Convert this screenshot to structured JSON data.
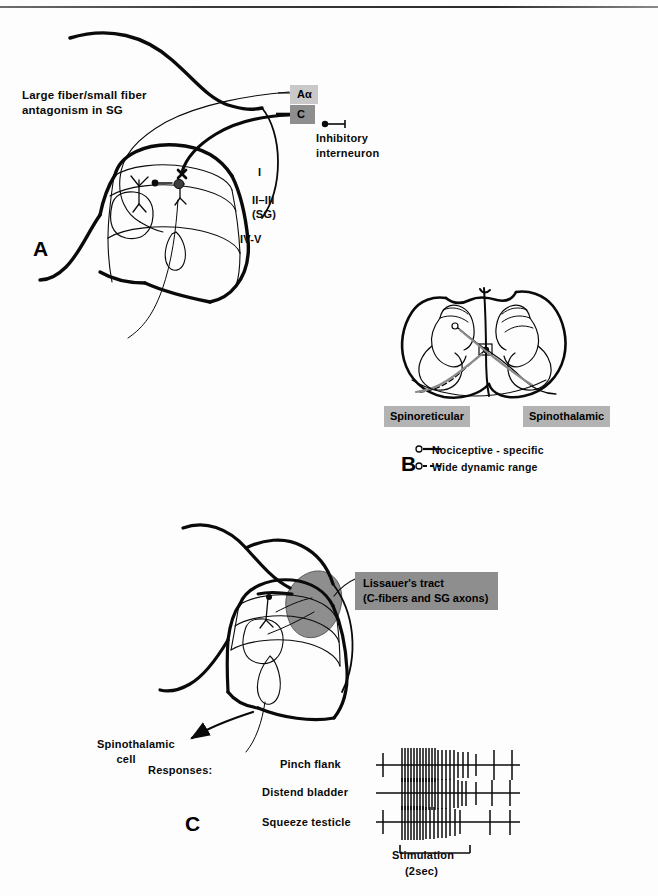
{
  "figure": {
    "panels": {
      "a": {
        "letter": "A",
        "title": "Large fiber/small fiber\nantagonism in SG",
        "fiber_aalpha": "Aα",
        "fiber_c": "C",
        "inhibitory": "Inhibitory\ninterneuron",
        "lamina_1": "I",
        "lamina_2_3": "II–III",
        "lamina_sg": "(SG)",
        "lamina_4_5": "IV-V"
      },
      "b": {
        "letter": "B",
        "tract_left": "Spinoreticular",
        "tract_right": "Spinothalamic",
        "legend": [
          {
            "marker": "solid-line-circle",
            "label": "Nociceptive - specific"
          },
          {
            "marker": "dashed-line-circle",
            "label": "Wide dynamic range"
          }
        ]
      },
      "c": {
        "letter": "C",
        "lissauer": "Lissauer's tract\n(C-fibers and SG axons)",
        "spinothalamic_cell": "Spinothalamic\n      cell",
        "responses_label": "Responses:",
        "traces": [
          {
            "label": "Pinch flank"
          },
          {
            "label": "Distend bladder"
          },
          {
            "label": "Squeeze testicle"
          }
        ],
        "stimulation": "Stimulation",
        "stimulation_duration": "(2sec)"
      }
    },
    "colors": {
      "ink": "#0a0a0a",
      "shade_light": "#c9c9c9",
      "shade_mid": "#b3b3b3",
      "shade_dark": "#8e8e8e"
    }
  }
}
